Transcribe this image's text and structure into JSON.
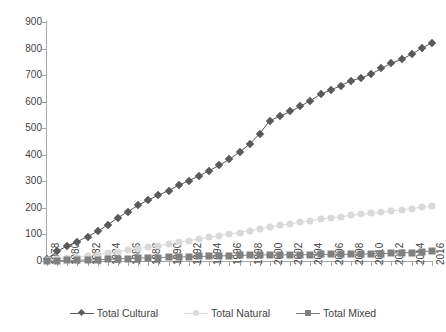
{
  "chart_data": {
    "type": "line",
    "title": "",
    "xlabel": "",
    "ylabel": "",
    "ylim": [
      0,
      900
    ],
    "y_ticks": [
      0,
      100,
      200,
      300,
      400,
      500,
      600,
      700,
      800,
      900
    ],
    "grid": false,
    "legend_position": "bottom",
    "x": [
      1978,
      1979,
      1980,
      1981,
      1982,
      1983,
      1984,
      1985,
      1986,
      1987,
      1988,
      1989,
      1990,
      1991,
      1992,
      1993,
      1994,
      1995,
      1996,
      1997,
      1998,
      1999,
      2000,
      2001,
      2002,
      2003,
      2004,
      2005,
      2006,
      2007,
      2008,
      2009,
      2010,
      2011,
      2012,
      2013,
      2014,
      2015,
      2016
    ],
    "x_tick_labels": [
      "1978",
      "1980",
      "1982",
      "1984",
      "1986",
      "1988",
      "1990",
      "1992",
      "1994",
      "1996",
      "1998",
      "2000",
      "2002",
      "2004",
      "2006",
      "2008",
      "2010",
      "2012",
      "2014",
      "2016"
    ],
    "series": [
      {
        "name": "Total Cultural",
        "color": "#595959",
        "marker": "diamond",
        "values": [
          8,
          36,
          57,
          73,
          92,
          112,
          136,
          163,
          186,
          210,
          230,
          248,
          265,
          285,
          303,
          320,
          340,
          360,
          383,
          410,
          440,
          480,
          529,
          545,
          563,
          582,
          604,
          628,
          644,
          660,
          679,
          689,
          704,
          725,
          745,
          759,
          779,
          802,
          821
        ]
      },
      {
        "name": "Total Natural",
        "color": "#d9d9d9",
        "marker": "circle",
        "values": [
          4,
          8,
          11,
          15,
          20,
          24,
          29,
          35,
          41,
          47,
          52,
          58,
          63,
          70,
          77,
          83,
          89,
          95,
          102,
          107,
          114,
          121,
          128,
          134,
          140,
          146,
          152,
          158,
          162,
          166,
          172,
          176,
          180,
          183,
          188,
          193,
          197,
          203,
          206
        ]
      },
      {
        "name": "Total Mixed",
        "color": "#808080",
        "marker": "square",
        "values": [
          0,
          1,
          2,
          3,
          4,
          5,
          6,
          8,
          9,
          11,
          12,
          13,
          14,
          15,
          16,
          17,
          18,
          19,
          20,
          21,
          22,
          23,
          23,
          23,
          23,
          23,
          24,
          25,
          25,
          25,
          25,
          26,
          27,
          28,
          29,
          31,
          32,
          35,
          38
        ]
      }
    ]
  },
  "legend": {
    "items": [
      {
        "label": "Total Cultural"
      },
      {
        "label": "Total Natural"
      },
      {
        "label": "Total Mixed"
      }
    ]
  }
}
